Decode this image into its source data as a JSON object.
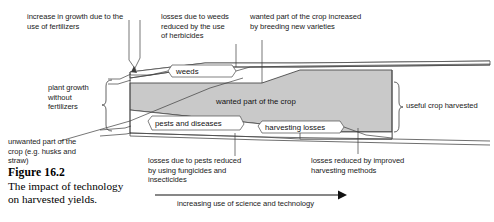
{
  "figure": {
    "number": "Figure 16.2",
    "caption": "The impact of technology\non harvested yields."
  },
  "diagram": {
    "title": "The impact of technology on harvested yields",
    "fill_color": "#c9c9c9",
    "stroke_color": "#5a5a5a",
    "band_labels": [
      {
        "id": "weeds",
        "text": "weeds"
      },
      {
        "id": "wanted-part-of-crop",
        "text": "wanted part of the crop"
      },
      {
        "id": "pests-and-diseases",
        "text": "pests and diseases"
      },
      {
        "id": "harvesting-losses",
        "text": "harvesting losses"
      }
    ],
    "annotations": [
      {
        "id": "fertilizers",
        "text": "increase in growth due to the\nuse of fertilizers"
      },
      {
        "id": "herbicides",
        "text": "losses due to weeds\nreduced  by the use\nof herbicides"
      },
      {
        "id": "breeding",
        "text": "wanted part of the crop increased\nby breeding new varieties"
      },
      {
        "id": "plant-growth",
        "text": "plant growth\nwithout\nfertilizers"
      },
      {
        "id": "unwanted-part",
        "text": "unwanted part of the\ncrop (e.g. husks and\nstraw)"
      },
      {
        "id": "useful-crop",
        "text": "useful crop harvested"
      },
      {
        "id": "fungicides",
        "text": "losses due to pests reduced\nby using fungicides and\ninsecticides"
      },
      {
        "id": "harvest-methods",
        "text": "losses reduced by improved\nharvesting methods"
      }
    ],
    "axis": {
      "label": "increasing use of science and technology"
    }
  }
}
